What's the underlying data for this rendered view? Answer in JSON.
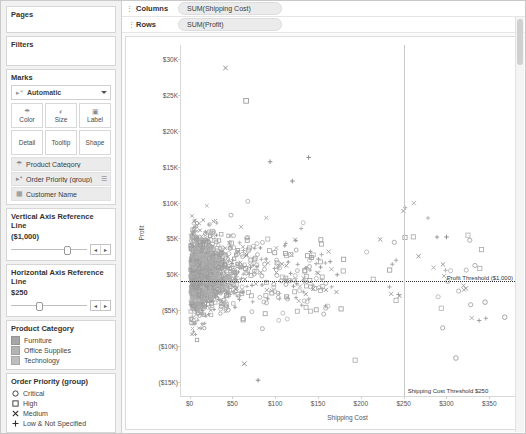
{
  "left_panel": {
    "pages": {
      "title": "Pages"
    },
    "filters": {
      "title": "Filters"
    },
    "marks": {
      "title": "Marks",
      "type_label": "Automatic",
      "type_icon": "automatic-mark-icon",
      "buttons": [
        {
          "label": "Color",
          "icon": "color-palette-icon"
        },
        {
          "label": "Size",
          "icon": "size-icon"
        },
        {
          "label": "Label",
          "icon": "label-icon"
        },
        {
          "label": "Detail",
          "icon": "detail-icon"
        },
        {
          "label": "Tooltip",
          "icon": "tooltip-icon"
        },
        {
          "label": "Shape",
          "icon": "shape-icon"
        }
      ],
      "pills": [
        {
          "label": "Product Category",
          "icon": "color-palette-icon",
          "end_icon": ""
        },
        {
          "label": "Order Priority (group)",
          "icon": "shape-icon",
          "end_icon": "shape-list-icon"
        },
        {
          "label": "Customer Name",
          "icon": "detail-icon",
          "end_icon": ""
        }
      ]
    },
    "parameters": [
      {
        "title": "Vertical Axis Reference Line",
        "value": "($1,000)",
        "slider_pct": 70,
        "prev_label": "◂",
        "next_label": "▸"
      },
      {
        "title": "Horizontal Axis Reference Line",
        "value": "$250",
        "slider_pct": 33,
        "prev_label": "◂",
        "next_label": "▸"
      }
    ],
    "color_legend": {
      "title": "Product Category",
      "items": [
        {
          "label": "Furniture",
          "color": "#a6a6a6"
        },
        {
          "label": "Office Supplies",
          "color": "#b3b3b3"
        },
        {
          "label": "Technology",
          "color": "#bdbdbd"
        }
      ]
    },
    "shape_legend": {
      "title": "Order Priority (group)",
      "items": [
        {
          "label": "Critical",
          "shape": "circle"
        },
        {
          "label": "High",
          "shape": "square"
        },
        {
          "label": "Medium",
          "shape": "cross-x"
        },
        {
          "label": "Low & Not Specified",
          "shape": "plus"
        }
      ]
    }
  },
  "shelves": {
    "columns": {
      "label": "Columns",
      "icon": "columns-grip-icon",
      "pill": "SUM(Shipping Cost)"
    },
    "rows": {
      "label": "Rows",
      "icon": "rows-grip-icon",
      "pill": "SUM(Profit)"
    }
  },
  "chart_data": {
    "type": "scatter",
    "title": "",
    "xlabel": "Shipping Cost",
    "ylabel": "Profit",
    "xlim": [
      -10,
      380
    ],
    "ylim": [
      -17000,
      32000
    ],
    "xticks": [
      0,
      50,
      100,
      150,
      200,
      250,
      300,
      350
    ],
    "xticklabels": [
      "$0",
      "$50",
      "$100",
      "$150",
      "$200",
      "$250",
      "$300",
      "$350"
    ],
    "yticks": [
      30000,
      25000,
      20000,
      15000,
      10000,
      5000,
      0,
      -5000,
      -10000,
      -15000
    ],
    "yticklabels": [
      "$30K",
      "$25K",
      "$20K",
      "$15K",
      "$10K",
      "$5K",
      "$0K",
      "($5K)",
      "($10K)",
      "($15K)"
    ],
    "grid": false,
    "legend_position": "right-panel",
    "reference_lines": [
      {
        "orientation": "horizontal",
        "value": -1000,
        "label": "Profit Threshold ($1,000)",
        "style": "dotted"
      },
      {
        "orientation": "vertical",
        "value": 250,
        "label": "Shipping Cost Threshold $250",
        "style": "solid"
      }
    ],
    "series": [
      {
        "name": "Critical",
        "shape": "circle"
      },
      {
        "name": "High",
        "shape": "square"
      },
      {
        "name": "Medium",
        "shape": "cross-x"
      },
      {
        "name": "Low & Not Specified",
        "shape": "plus"
      }
    ],
    "notable_points": [
      {
        "x": 42,
        "y": 28800,
        "shape": "cross-x"
      },
      {
        "x": 66,
        "y": 24200,
        "shape": "square"
      },
      {
        "x": 94,
        "y": 15700,
        "shape": "plus"
      },
      {
        "x": 139,
        "y": 16300,
        "shape": "plus"
      },
      {
        "x": 120,
        "y": 13000,
        "shape": "plus"
      },
      {
        "x": 300,
        "y": 5200,
        "shape": "plus"
      },
      {
        "x": 345,
        "y": -3900,
        "shape": "circle"
      },
      {
        "x": 368,
        "y": -6000,
        "shape": "circle"
      },
      {
        "x": 311,
        "y": -11700,
        "shape": "circle"
      },
      {
        "x": 80,
        "y": -14800,
        "shape": "plus"
      },
      {
        "x": 64,
        "y": -12500,
        "shape": "cross-x"
      }
    ]
  }
}
